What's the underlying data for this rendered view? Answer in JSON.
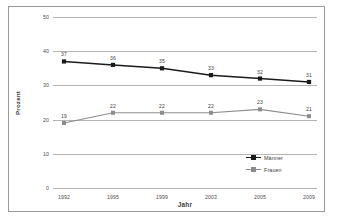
{
  "chart_data": {
    "type": "line",
    "title": "",
    "xlabel": "Jahr",
    "ylabel": "Prozent",
    "categories": [
      "1992",
      "1995",
      "1999",
      "2003",
      "2005",
      "2009"
    ],
    "series": [
      {
        "name": "Männer",
        "values": [
          37,
          36,
          35,
          33,
          32,
          31
        ],
        "color": "#1a1a1a",
        "marker": "diamond"
      },
      {
        "name": "Frauen",
        "values": [
          19,
          22,
          22,
          22,
          23,
          21
        ],
        "color": "#8c8c8c",
        "marker": "square"
      }
    ],
    "ylim": [
      0,
      50
    ],
    "yticks": [
      "0",
      "10",
      "20",
      "30",
      "40",
      "50"
    ],
    "grid": true,
    "grid_axis": "y",
    "legend_position": "bottom-right",
    "data_labels": true
  },
  "colors": {
    "maenner": "#1a1a1a",
    "frauen": "#8c8c8c",
    "gridline": "#b4b4b4",
    "frame": "#9a9a9a",
    "background": "#ffffff",
    "tick_text": "#4a4a4a"
  }
}
